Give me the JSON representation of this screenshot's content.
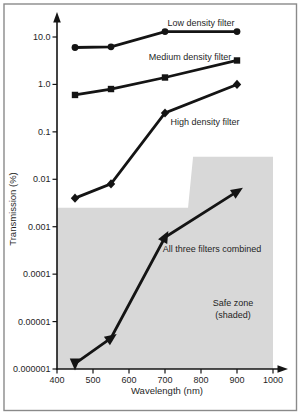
{
  "figure": {
    "colors": {
      "background": "#ffffff",
      "frame": "#8a8a8a",
      "line": "#141414",
      "shade": "#d8d8d8",
      "text": "#1f1f1f"
    }
  },
  "chart_data": {
    "type": "line",
    "title": "",
    "xlabel": "Wavelength (nm)",
    "ylabel": "Transmission (%)",
    "x_axis": "linear",
    "y_axis": "log",
    "xlim": [
      400,
      1000
    ],
    "ylim": [
      1e-06,
      30
    ],
    "grid": false,
    "x_ticks": [
      400,
      500,
      600,
      700,
      800,
      900,
      1000
    ],
    "y_tick_labels": [
      "10.0",
      "1.0",
      "0.1",
      "0.01",
      "0.001",
      "0.0001",
      "0.00001",
      "0.000001"
    ],
    "y_tick_values": [
      10,
      1,
      0.1,
      0.01,
      0.001,
      0.0001,
      1e-05,
      1e-06
    ],
    "x": [
      450,
      550,
      700,
      900
    ],
    "series": [
      {
        "name": "Low density filter",
        "marker": "circle",
        "values": [
          6,
          6.2,
          13,
          13
        ]
      },
      {
        "name": "Medium density filter",
        "marker": "square",
        "values": [
          0.6,
          0.8,
          1.4,
          3.2
        ]
      },
      {
        "name": "High density filter",
        "marker": "diamond",
        "values": [
          0.004,
          0.008,
          0.25,
          1.0
        ]
      },
      {
        "name": "All three filters combined",
        "marker": "arrow",
        "values": [
          1.3e-06,
          4.5e-06,
          0.0006,
          0.0055
        ]
      }
    ],
    "safe_zone": {
      "label_line1": "Safe zone",
      "label_line2": "(shaded)",
      "boundary": [
        {
          "x": 400,
          "y": 0.0025
        },
        {
          "x": 764,
          "y": 0.0025
        },
        {
          "x": 778,
          "y": 0.03
        },
        {
          "x": 1000,
          "y": 0.03
        }
      ],
      "floor": 1e-06
    }
  }
}
